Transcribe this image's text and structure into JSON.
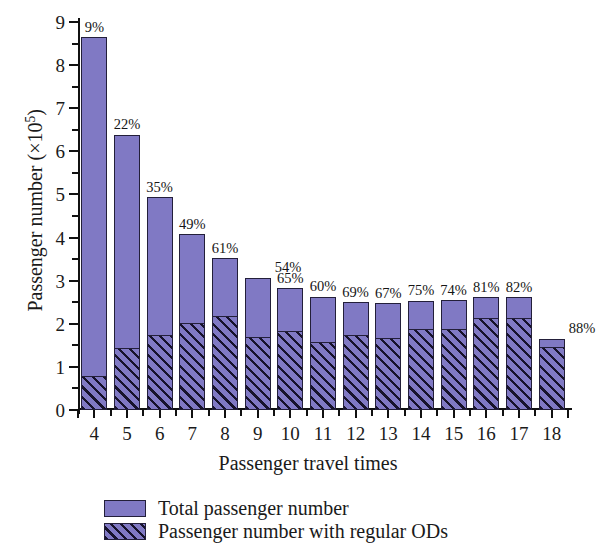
{
  "chart_data": {
    "type": "bar",
    "title": "",
    "subtitle": "",
    "xlabel": "Passenger travel times",
    "ylabel": "Passenger number (×10⁵)",
    "ylabel_base": "Passenger number (×10",
    "ylabel_exp": "5",
    "ylabel_close": ")",
    "categories": [
      "4",
      "5",
      "6",
      "7",
      "8",
      "9",
      "10",
      "11",
      "12",
      "13",
      "14",
      "15",
      "16",
      "17",
      "18"
    ],
    "xlim": [
      3.4,
      18.6
    ],
    "ylim": [
      0,
      9
    ],
    "yticks": [
      0,
      1,
      2,
      3,
      4,
      5,
      6,
      7,
      8,
      9
    ],
    "ytick_labels": [
      "0",
      "1",
      "2",
      "3",
      "4",
      "5",
      "6",
      "7",
      "8",
      "9"
    ],
    "yminor_step": 0.5,
    "grid": false,
    "legend_position": "below-axes-left",
    "units": "×10^5 passengers",
    "series": [
      {
        "name": "Total passenger number",
        "style": "solid",
        "color": "#8079c4",
        "values": [
          8.65,
          6.38,
          4.94,
          4.08,
          3.52,
          3.07,
          2.82,
          2.63,
          2.5,
          2.48,
          2.53,
          2.55,
          2.62,
          2.61,
          1.65
        ]
      },
      {
        "name": "Passenger number with regular ODs",
        "style": "hatched",
        "color": "#8079c4",
        "hatch_color": "#17132c",
        "values": [
          0.8,
          1.45,
          1.74,
          2.02,
          2.18,
          1.69,
          1.83,
          1.58,
          1.73,
          1.68,
          1.89,
          1.89,
          2.13,
          2.14,
          1.47
        ]
      }
    ],
    "annotations": {
      "label": "percentage of passengers with regular ODs",
      "values": [
        "9%",
        "22%",
        "35%",
        "49%",
        "61%",
        "54%",
        "65%",
        "60%",
        "69%",
        "67%",
        "75%",
        "74%",
        "81%",
        "82%",
        "88%"
      ]
    }
  },
  "legend": {
    "items": [
      {
        "label": "Total passenger number",
        "swatch": "solid-purple-swatch"
      },
      {
        "label": "Passenger number with regular ODs",
        "swatch": "hatched-purple-swatch"
      }
    ]
  },
  "colors": {
    "bar_fill": "#8079c4",
    "bar_edge": "#231f3a",
    "hatch": "#17132c",
    "axis": "#111111",
    "text": "#1a1a1a",
    "background": "#ffffff"
  }
}
